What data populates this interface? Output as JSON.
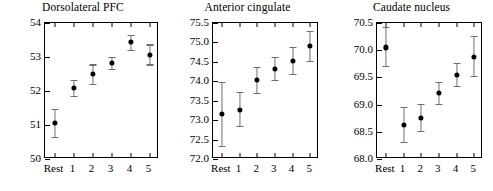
{
  "figure": {
    "background": "#ffffff",
    "marker_color": "#000000",
    "errorbar_color": "#6f6f6f",
    "axis_color": "#000000"
  },
  "chart_data": [
    {
      "type": "scatter",
      "title": "Dorsolateral PFC",
      "xlabel": "",
      "ylabel": "Relative rCBF",
      "categories": [
        "Rest",
        "1",
        "2",
        "3",
        "4",
        "5"
      ],
      "values": [
        51.06,
        52.08,
        52.51,
        52.82,
        53.45,
        53.07
      ],
      "err_low": [
        50.64,
        51.85,
        52.2,
        52.66,
        53.22,
        52.78
      ],
      "err_high": [
        51.47,
        52.33,
        52.78,
        53.0,
        53.65,
        53.37
      ],
      "ylim": [
        50,
        54
      ],
      "yticks": [
        50,
        51,
        52,
        53,
        54
      ],
      "ytick_labels": [
        "50",
        "51",
        "52",
        "53",
        "54"
      ],
      "grid": false,
      "legend": "none"
    },
    {
      "type": "scatter",
      "title": "Anterior cingulate",
      "xlabel": "",
      "ylabel": "",
      "categories": [
        "Rest",
        "1",
        "2",
        "3",
        "4",
        "5"
      ],
      "values": [
        73.16,
        73.27,
        74.04,
        74.31,
        74.53,
        74.91
      ],
      "err_low": [
        72.34,
        72.85,
        73.71,
        74.03,
        74.19,
        74.52
      ],
      "err_high": [
        73.99,
        73.73,
        74.38,
        74.62,
        74.89,
        75.29
      ],
      "ylim": [
        72.0,
        75.5
      ],
      "yticks": [
        72.0,
        72.5,
        73.0,
        73.5,
        74.0,
        74.5,
        75.0,
        75.5
      ],
      "ytick_labels": [
        "72.0",
        "72.5",
        "73.0",
        "73.5",
        "74.0",
        "74.5",
        "75.0",
        "75.5"
      ],
      "grid": false,
      "legend": "none"
    },
    {
      "type": "scatter",
      "title": "Caudate nucleus",
      "xlabel": "",
      "ylabel": "",
      "categories": [
        "Rest",
        "1",
        "2",
        "3",
        "4",
        "5"
      ],
      "values": [
        70.05,
        68.63,
        68.76,
        69.22,
        69.54,
        69.88
      ],
      "err_low": [
        69.71,
        68.31,
        68.51,
        69.02,
        69.34,
        69.52
      ],
      "err_high": [
        70.43,
        68.96,
        69.02,
        69.42,
        69.76,
        70.26
      ],
      "ylim": [
        68.0,
        70.5
      ],
      "yticks": [
        68.0,
        68.5,
        69.0,
        69.5,
        70.0,
        70.5
      ],
      "ytick_labels": [
        "68.0",
        "68.5",
        "69.0",
        "69.5",
        "70.0",
        "70.5"
      ],
      "grid": false,
      "legend": "none"
    }
  ]
}
